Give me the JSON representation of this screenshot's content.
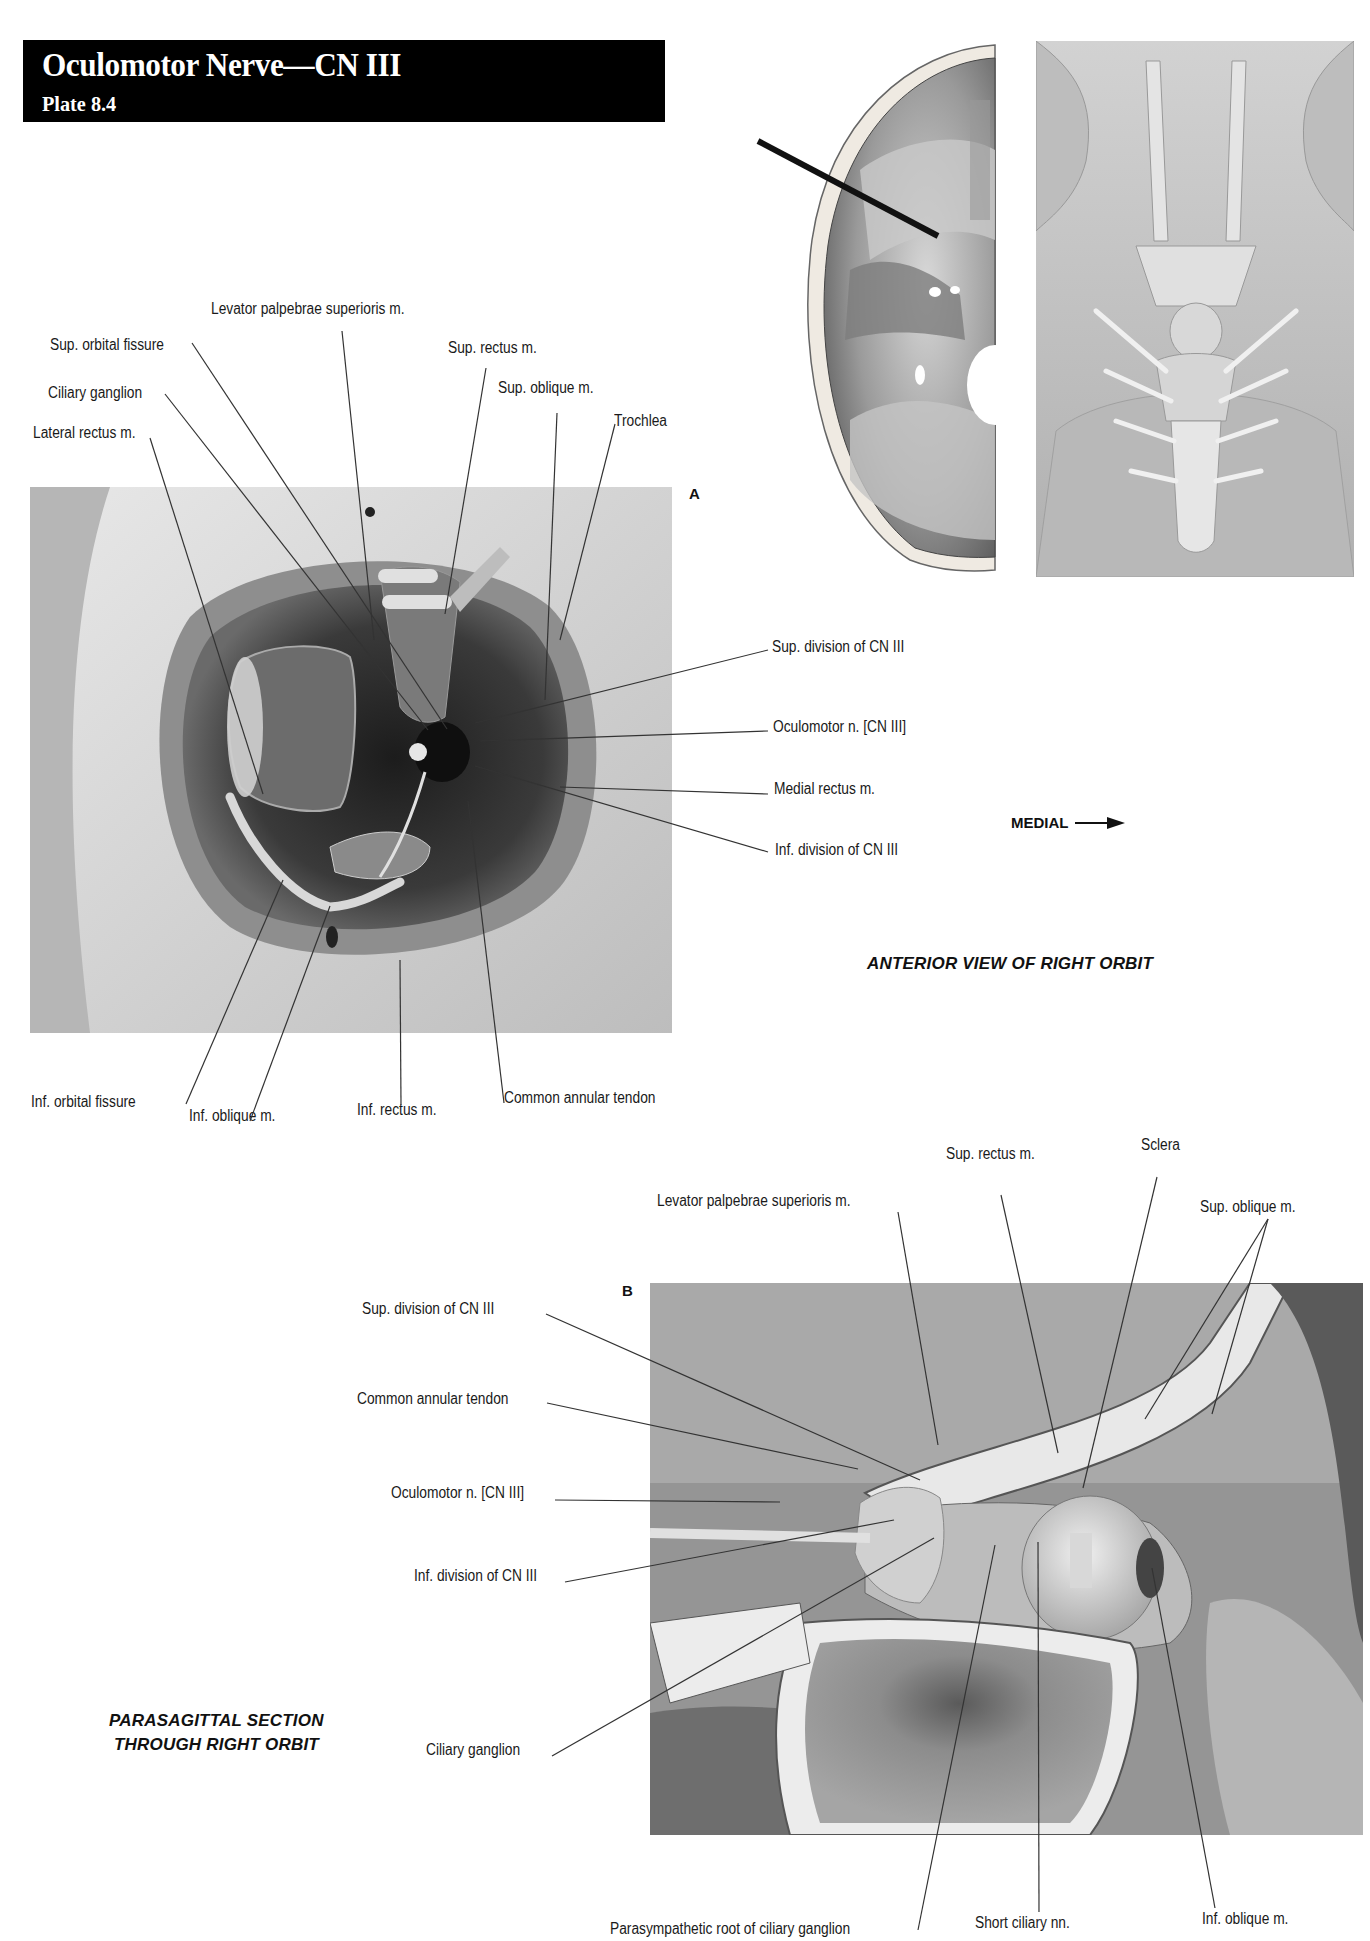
{
  "header": {
    "title": "Oculomotor Nerve—CN III",
    "subtitle": "Plate 8.4"
  },
  "figure_a": {
    "letter": "A",
    "view_title": "ANTERIOR VIEW OF RIGHT ORBIT",
    "orientation_label": "MEDIAL",
    "labels": {
      "levator": "Levator palpebrae superioris m.",
      "sup_orbital_fissure": "Sup. orbital fissure",
      "sup_rectus": "Sup. rectus m.",
      "ciliary_ganglion": "Ciliary ganglion",
      "sup_oblique": "Sup. oblique m.",
      "trochlea": "Trochlea",
      "lateral_rectus": "Lateral rectus m.",
      "sup_division": "Sup. division of CN III",
      "oculomotor_n": "Oculomotor n. [CN III]",
      "medial_rectus": "Medial rectus m.",
      "inf_division": "Inf. division of CN III",
      "inf_orbital_fissure": "Inf. orbital fissure",
      "inf_oblique": "Inf. oblique m.",
      "inf_rectus": "Inf. rectus m.",
      "common_annular_tendon": "Common annular tendon"
    }
  },
  "inset": {
    "skull_base": "cranial-fossa-illustration",
    "brain_base": "brainstem-ventral-illustration"
  },
  "figure_b": {
    "letter": "B",
    "view_title_line1": "PARASAGITTAL SECTION",
    "view_title_line2": "THROUGH RIGHT ORBIT",
    "labels": {
      "sup_rectus": "Sup. rectus m.",
      "sclera": "Sclera",
      "levator": "Levator palpebrae superioris m.",
      "sup_oblique": "Sup. oblique  m.",
      "sup_division": "Sup. division of CN III",
      "common_annular_tendon": "Common annular tendon",
      "oculomotor_n": "Oculomotor n. [CN III]",
      "inf_division": "Inf. division of CN III",
      "ciliary_ganglion": "Ciliary ganglion",
      "parasympathetic_root": "Parasympathetic root of ciliary ganglion",
      "short_ciliary": "Short ciliary nn.",
      "inf_oblique": "Inf. oblique m."
    }
  }
}
